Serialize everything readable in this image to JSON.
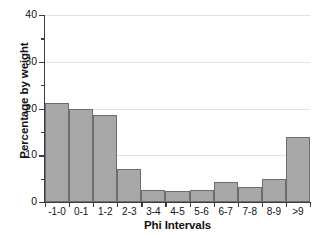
{
  "chart_data": {
    "type": "bar",
    "title": "",
    "xlabel": "Phi Intervals",
    "ylabel": "Percentage by weight",
    "categories": [
      "-1-0",
      "0-1",
      "1-2",
      "2-3",
      "3-4",
      "4-5",
      "5-6",
      "6-7",
      "7-8",
      "8-9",
      ">9"
    ],
    "values": [
      21.2,
      19.8,
      18.6,
      7.0,
      2.6,
      2.3,
      2.6,
      4.2,
      3.2,
      5.0,
      14.0
    ],
    "ylim": [
      0,
      40
    ],
    "xlim_note": "categorical, contiguous histogram bars",
    "y_major_ticks": [
      0,
      10,
      20,
      30,
      40
    ],
    "y_minor_ticks": [
      5,
      15,
      25,
      35
    ],
    "y_tick_labels": [
      "0",
      "10",
      "20",
      "30",
      "40"
    ],
    "grid": "horizontal gridlines at major y ticks",
    "legend": "none",
    "bar_fill_color": "#a8a8a8",
    "bar_border_color": "#6d6d6d",
    "gridline_color": "#e2e2e2",
    "axis_color": "#3c3c3c",
    "background_color": "#ffffff"
  }
}
